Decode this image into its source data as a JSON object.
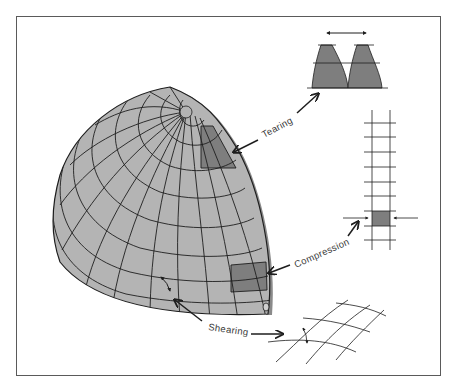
{
  "diagram": {
    "labels": {
      "tearing": "Tearing",
      "compression": "Compression",
      "shearing": "Shearing"
    },
    "colors": {
      "globe_fill": "#b4b4b4",
      "highlight_fill": "#7e7e7e",
      "grid_line": "#1e1e1e",
      "frame": "#5a5a5a",
      "text": "#3a3a3a"
    }
  }
}
